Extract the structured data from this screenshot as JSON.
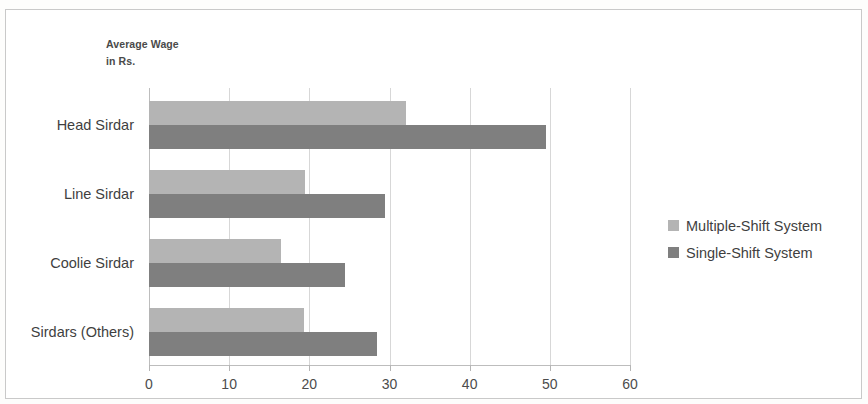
{
  "chart_data": {
    "type": "bar",
    "orientation": "horizontal",
    "title": "",
    "axis_title_lines": [
      "Average Wage",
      "in Rs."
    ],
    "xlabel": "",
    "ylabel": "",
    "categories": [
      "Head Sirdar",
      "Line Sirdar",
      "Coolie Sirdar",
      "Sirdars (Others)"
    ],
    "series": [
      {
        "name": "Multiple-Shift System",
        "color": "#b4b4b4",
        "values": [
          32,
          19.5,
          16.5,
          19.3
        ]
      },
      {
        "name": "Single-Shift System",
        "color": "#7f7f7f",
        "values": [
          49.5,
          29.5,
          24.5,
          28.4
        ]
      }
    ],
    "xlim": [
      0,
      60
    ],
    "xticks": [
      0,
      10,
      20,
      30,
      40,
      50,
      60
    ],
    "xtick_labels": [
      "0",
      "10",
      "20",
      "30",
      "40",
      "50",
      "60"
    ],
    "grid": "vertical",
    "legend_position": "right"
  },
  "legend": {
    "items": [
      {
        "label": "Multiple-Shift System",
        "color": "#b4b4b4"
      },
      {
        "label": "Single-Shift System",
        "color": "#7f7f7f"
      }
    ]
  },
  "axis_title": {
    "line1": "Average Wage",
    "line2": "in Rs."
  },
  "colors": {
    "light_series": "#b4b4b4",
    "dark_series": "#7f7f7f",
    "gridline": "#d7d7d7",
    "frame": "#c9c9c9",
    "text": "#3f3f3f"
  }
}
